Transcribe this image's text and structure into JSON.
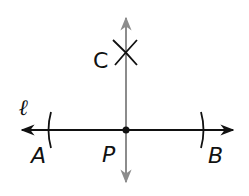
{
  "diagram": {
    "labels": {
      "line": "ℓ",
      "A": "A",
      "B": "B",
      "P": "P",
      "C": "C"
    },
    "colors": {
      "main_line": "#111111",
      "perpendicular_line": "#8c8c8c",
      "point": "#111111",
      "background": "#ffffff"
    },
    "elements": [
      {
        "type": "line",
        "name": "line-l",
        "from": [
          20,
          130
        ],
        "to": [
          235,
          130
        ],
        "arrows": "both",
        "color": "#111111"
      },
      {
        "type": "line",
        "name": "perpendicular-line",
        "from": [
          126,
          15
        ],
        "to": [
          126,
          185
        ],
        "arrows": "both",
        "color": "#8c8c8c"
      },
      {
        "type": "point",
        "name": "P",
        "at": [
          126,
          130
        ]
      },
      {
        "type": "arc",
        "name": "arc-A",
        "center_x": 49,
        "y_range": [
          112,
          148
        ]
      },
      {
        "type": "arc",
        "name": "arc-B",
        "center_x": 203,
        "y_range": [
          112,
          148
        ]
      },
      {
        "type": "arc-intersection",
        "name": "C",
        "at": [
          126,
          52
        ]
      }
    ]
  }
}
